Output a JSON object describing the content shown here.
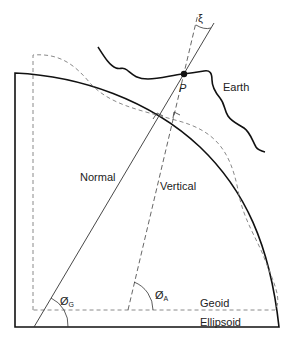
{
  "diagram": {
    "type": "geodesy-deflection-of-vertical",
    "colors": {
      "line": "#111111",
      "dashed": "#8a8a8a",
      "text": "#222222",
      "background": "#ffffff"
    },
    "labels": {
      "earth": "Earth",
      "point": "P",
      "xi": "ξ",
      "normal": "Normal",
      "vertical": "Vertical",
      "geoid": "Geoid",
      "ellipsoid": "Ellipsoid",
      "phi_g": "Ø",
      "phi_g_sub": "G",
      "phi_a": "Ø",
      "phi_a_sub": "A"
    }
  }
}
